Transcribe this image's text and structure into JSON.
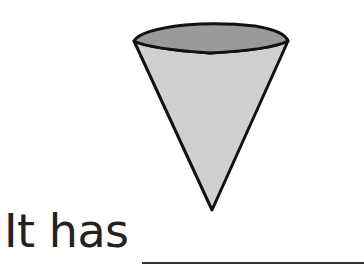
{
  "figure": {
    "shape": "cone",
    "orientation": "inverted",
    "colors": {
      "top_face": "#9a9a9a",
      "body": "#d0d0d0",
      "outline": "#111111"
    }
  },
  "prompt": {
    "text": "It has",
    "blank": "______________"
  }
}
